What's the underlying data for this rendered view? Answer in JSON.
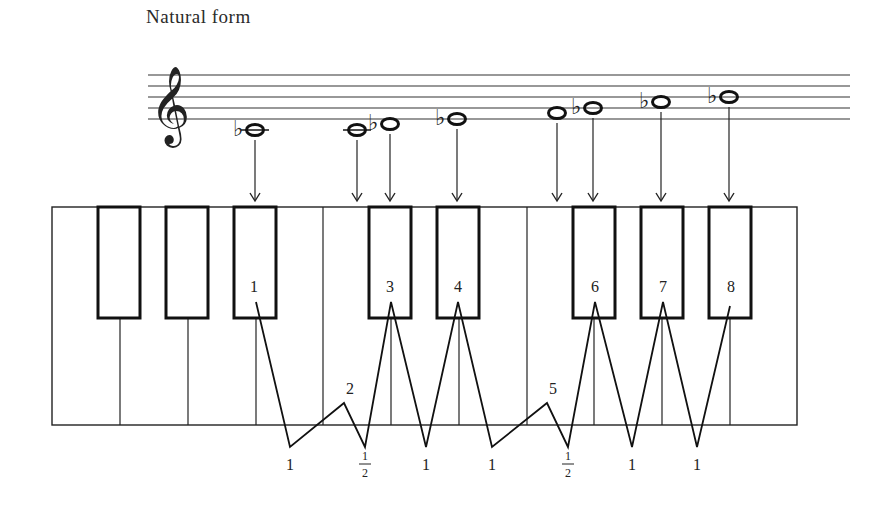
{
  "title": "Natural form",
  "clef": "treble-clef",
  "staff": {
    "x_start": 148,
    "x_end": 850,
    "lines_y": [
      75,
      86,
      97,
      108,
      119
    ]
  },
  "notes": [
    {
      "name": "Bb3",
      "accidental": "flat",
      "x": 255,
      "y": 130,
      "ledger": true,
      "arrow_to_x": 255
    },
    {
      "name": "C4",
      "accidental": "",
      "x": 357,
      "y": 130,
      "ledger": true,
      "arrow_to_x": 357
    },
    {
      "name": "Db4",
      "accidental": "flat",
      "x": 390,
      "y": 124,
      "ledger": false,
      "arrow_to_x": 390
    },
    {
      "name": "Eb4",
      "accidental": "flat",
      "x": 457,
      "y": 119,
      "ledger": false,
      "arrow_to_x": 457
    },
    {
      "name": "F4",
      "accidental": "",
      "x": 557,
      "y": 113,
      "ledger": false,
      "arrow_to_x": 557
    },
    {
      "name": "Gb4",
      "accidental": "flat",
      "x": 593,
      "y": 108,
      "ledger": false,
      "arrow_to_x": 593
    },
    {
      "name": "Ab4",
      "accidental": "flat",
      "x": 661,
      "y": 102,
      "ledger": false,
      "arrow_to_x": 661
    },
    {
      "name": "Bb4",
      "accidental": "flat",
      "x": 729,
      "y": 97,
      "ledger": false,
      "arrow_to_x": 729
    }
  ],
  "keyboard": {
    "x": 52,
    "y": 207,
    "width": 745,
    "height": 218,
    "white_key_dividers_x": [
      120,
      188,
      256,
      323,
      391,
      459,
      527,
      594,
      662,
      730
    ],
    "black_keys": [
      {
        "x": 98,
        "width": 42
      },
      {
        "x": 166,
        "width": 42
      },
      {
        "x": 234,
        "width": 42
      },
      {
        "x": 369,
        "width": 42
      },
      {
        "x": 437,
        "width": 42
      },
      {
        "x": 573,
        "width": 42
      },
      {
        "x": 641,
        "width": 42
      },
      {
        "x": 709,
        "width": 42
      }
    ],
    "black_key_bottom_y": 318
  },
  "scale_degrees": [
    {
      "label": "1",
      "x": 254,
      "y": 292
    },
    {
      "label": "2",
      "x": 350,
      "y": 394
    },
    {
      "label": "3",
      "x": 390,
      "y": 292
    },
    {
      "label": "4",
      "x": 458,
      "y": 292
    },
    {
      "label": "5",
      "x": 553,
      "y": 394
    },
    {
      "label": "6",
      "x": 595,
      "y": 292
    },
    {
      "label": "7",
      "x": 663,
      "y": 292
    },
    {
      "label": "8",
      "x": 731,
      "y": 292
    }
  ],
  "intervals": [
    {
      "label": "1",
      "x": 290
    },
    {
      "label": "½",
      "num": "1",
      "den": "2",
      "x": 365
    },
    {
      "label": "1",
      "x": 426
    },
    {
      "label": "1",
      "x": 492
    },
    {
      "label": "½",
      "num": "1",
      "den": "2",
      "x": 568
    },
    {
      "label": "1",
      "x": 632
    },
    {
      "label": "1",
      "x": 697
    }
  ],
  "zigzag_points": [
    [
      256,
      302
    ],
    [
      290,
      447
    ],
    [
      344,
      403
    ],
    [
      365,
      447
    ],
    [
      391,
      302
    ],
    [
      426,
      447
    ],
    [
      458,
      302
    ],
    [
      492,
      447
    ],
    [
      547,
      403
    ],
    [
      568,
      447
    ],
    [
      595,
      302
    ],
    [
      632,
      447
    ],
    [
      663,
      302
    ],
    [
      697,
      447
    ],
    [
      730,
      306
    ]
  ]
}
